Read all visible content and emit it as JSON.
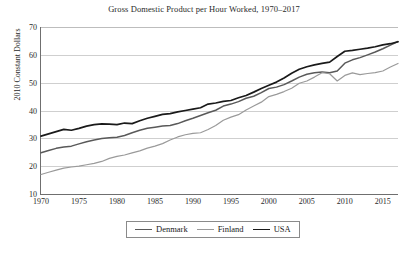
{
  "chart_data": {
    "type": "line",
    "title": "Gross Domestic Product per Hour Worked, 1970–2017",
    "xlabel": "",
    "ylabel": "2010 Constant Dollars",
    "xlim": [
      1970,
      2017
    ],
    "ylim": [
      10,
      70
    ],
    "yticks": [
      10,
      20,
      30,
      40,
      50,
      60,
      70
    ],
    "xticks": [
      1970,
      1975,
      1980,
      1985,
      1990,
      1995,
      2000,
      2005,
      2010,
      2015
    ],
    "grid": true,
    "legend_position": "bottom-center",
    "x": [
      1970,
      1971,
      1972,
      1973,
      1974,
      1975,
      1976,
      1977,
      1978,
      1979,
      1980,
      1981,
      1982,
      1983,
      1984,
      1985,
      1986,
      1987,
      1988,
      1989,
      1990,
      1991,
      1992,
      1993,
      1994,
      1995,
      1996,
      1997,
      1998,
      1999,
      2000,
      2001,
      2002,
      2003,
      2004,
      2005,
      2006,
      2007,
      2008,
      2009,
      2010,
      2011,
      2012,
      2013,
      2014,
      2015,
      2016,
      2017
    ],
    "series": [
      {
        "name": "Denmark",
        "color": "#595959",
        "values": [
          24.8,
          25.6,
          26.4,
          26.9,
          27.2,
          28.0,
          28.8,
          29.4,
          29.9,
          30.2,
          30.4,
          31.0,
          32.0,
          32.9,
          33.6,
          34.0,
          34.4,
          34.6,
          35.3,
          36.3,
          37.2,
          38.2,
          39.2,
          40.1,
          41.6,
          42.3,
          43.2,
          44.4,
          45.1,
          46.4,
          47.9,
          48.4,
          49.3,
          50.6,
          52.0,
          53.0,
          53.6,
          53.8,
          53.6,
          54.2,
          57.0,
          58.2,
          59.0,
          60.0,
          61.0,
          62.2,
          63.5,
          64.8
        ]
      },
      {
        "name": "Finland",
        "color": "#9a9a9a",
        "values": [
          17.0,
          17.8,
          18.6,
          19.3,
          19.7,
          20.0,
          20.5,
          21.0,
          21.7,
          22.8,
          23.5,
          24.0,
          24.8,
          25.5,
          26.5,
          27.2,
          28.1,
          29.4,
          30.5,
          31.3,
          31.8,
          32.0,
          33.2,
          34.6,
          36.5,
          37.6,
          38.5,
          40.2,
          41.6,
          43.0,
          45.0,
          45.8,
          46.8,
          48.0,
          49.8,
          50.6,
          52.0,
          53.6,
          53.2,
          50.6,
          52.6,
          53.5,
          52.9,
          53.3,
          53.6,
          54.2,
          55.6,
          56.9
        ]
      },
      {
        "name": "USA",
        "color": "#1a1a1a",
        "values": [
          30.8,
          31.6,
          32.4,
          33.2,
          32.9,
          33.6,
          34.4,
          34.9,
          35.2,
          35.1,
          34.9,
          35.5,
          35.3,
          36.3,
          37.2,
          37.9,
          38.6,
          38.9,
          39.5,
          40.0,
          40.5,
          41.0,
          42.3,
          42.7,
          43.3,
          43.6,
          44.6,
          45.4,
          46.6,
          47.9,
          49.1,
          50.2,
          51.7,
          53.4,
          54.8,
          55.7,
          56.4,
          56.9,
          57.4,
          59.4,
          61.3,
          61.6,
          62.0,
          62.4,
          62.9,
          63.6,
          64.0,
          64.7
        ]
      }
    ]
  },
  "legend": {
    "items": [
      {
        "label": "Denmark"
      },
      {
        "label": "Finland"
      },
      {
        "label": "USA"
      }
    ]
  }
}
